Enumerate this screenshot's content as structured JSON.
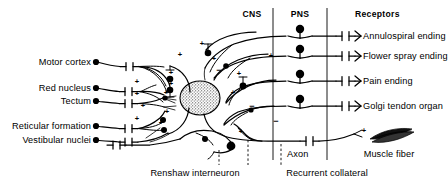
{
  "figure": {
    "width": 448,
    "height": 182,
    "background": "#ffffff",
    "ink": "#000000"
  },
  "columns": {
    "cns_header": "CNS",
    "pns_header": "PNS",
    "receptors_header": "Receptors"
  },
  "descending_inputs": [
    {
      "label": "Motor cortex",
      "y": 62
    },
    {
      "label": "Red nucleus",
      "y": 88
    },
    {
      "label": "Tectum",
      "y": 101
    },
    {
      "label": "Reticular formation",
      "y": 126
    },
    {
      "label": "Vestibular nuclei",
      "y": 140
    }
  ],
  "receptors": [
    {
      "label": "Annulospiral ending",
      "y": 36
    },
    {
      "label": "Flower spray ending",
      "y": 56
    },
    {
      "label": "Pain ending",
      "y": 81
    },
    {
      "label": "Golgi tendon organ",
      "y": 106
    }
  ],
  "effector": {
    "axon_label": "Axon",
    "muscle_label": "Muscle fiber"
  },
  "callouts": [
    {
      "label": "Renshaw interneuron",
      "x": 195,
      "y": 174
    },
    {
      "label": "Recurrent collateral",
      "x": 327,
      "y": 174
    }
  ],
  "synapse_signs": {
    "excitatory": "+",
    "inhibitory": "−"
  },
  "sign_markers": [
    {
      "sign": "+",
      "x": 171,
      "y": 75
    },
    {
      "sign": "+",
      "x": 171,
      "y": 86
    },
    {
      "sign": "+",
      "x": 166,
      "y": 95
    },
    {
      "sign": "+",
      "x": 137,
      "y": 84
    },
    {
      "sign": "+",
      "x": 137,
      "y": 96
    },
    {
      "sign": "+",
      "x": 143,
      "y": 108
    },
    {
      "sign": "+",
      "x": 137,
      "y": 121
    },
    {
      "sign": "+",
      "x": 161,
      "y": 125
    },
    {
      "sign": "+",
      "x": 167,
      "y": 114
    },
    {
      "sign": "+",
      "x": 202,
      "y": 46
    },
    {
      "sign": "+",
      "x": 180,
      "y": 57
    },
    {
      "sign": "+",
      "x": 214,
      "y": 61
    },
    {
      "sign": "+",
      "x": 239,
      "y": 76
    },
    {
      "sign": "+",
      "x": 233,
      "y": 95
    },
    {
      "sign": "+",
      "x": 241,
      "y": 134
    },
    {
      "sign": "+",
      "x": 364,
      "y": 133
    },
    {
      "sign": "−",
      "x": 219,
      "y": 73
    },
    {
      "sign": "−",
      "x": 252,
      "y": 109
    },
    {
      "sign": "−",
      "x": 276,
      "y": 124
    },
    {
      "sign": "+",
      "x": 271,
      "y": 58
    }
  ]
}
